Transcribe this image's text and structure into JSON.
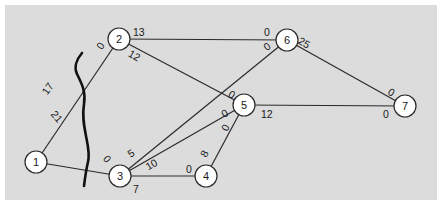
{
  "diagram": {
    "type": "network-flow",
    "background_color": "#dcdcdc",
    "nodes": [
      {
        "id": "1",
        "label": "1",
        "x": 36,
        "y": 162
      },
      {
        "id": "2",
        "label": "2",
        "x": 119,
        "y": 39
      },
      {
        "id": "3",
        "label": "3",
        "x": 120,
        "y": 176
      },
      {
        "id": "4",
        "label": "4",
        "x": 206,
        "y": 176
      },
      {
        "id": "5",
        "label": "5",
        "x": 244,
        "y": 105
      },
      {
        "id": "6",
        "label": "6",
        "x": 287,
        "y": 40
      },
      {
        "id": "7",
        "label": "7",
        "x": 405,
        "y": 106
      }
    ],
    "edges": [
      {
        "from": "1",
        "to": "2",
        "from_label": "17",
        "to_label": "0"
      },
      {
        "from": "1",
        "to": "3",
        "from_label": "21",
        "to_label": "0"
      },
      {
        "from": "2",
        "to": "6",
        "from_label": "13",
        "to_label": "0"
      },
      {
        "from": "2",
        "to": "5",
        "from_label": "12",
        "to_label": "0"
      },
      {
        "from": "3",
        "to": "6",
        "from_label": "5",
        "to_label": "0"
      },
      {
        "from": "3",
        "to": "5",
        "from_label": "10",
        "to_label": "0"
      },
      {
        "from": "3",
        "to": "4",
        "from_label": "7",
        "to_label": "0"
      },
      {
        "from": "4",
        "to": "5",
        "from_label": "8",
        "to_label": "0"
      },
      {
        "from": "5",
        "to": "7",
        "from_label": "12",
        "to_label": "0"
      },
      {
        "from": "6",
        "to": "7",
        "from_label": "25",
        "to_label": "0"
      }
    ],
    "cut_line": "wavy cut separating node 1 from nodes 2 and 3"
  }
}
